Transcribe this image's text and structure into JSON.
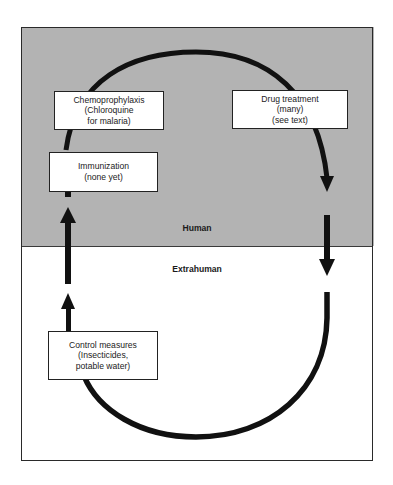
{
  "diagram": {
    "zones": {
      "human": {
        "label": "Human",
        "fill": "#b3b3b3"
      },
      "extrahuman": {
        "label": "Extrahuman",
        "fill": "#ffffff"
      }
    },
    "intervention_boxes": {
      "chemoprophylaxis": {
        "lines": [
          "Chemoprophylaxis",
          "(Chloroquine",
          "for malaria)"
        ]
      },
      "drug_treatment": {
        "lines": [
          "Drug treatment",
          "(many)",
          "(see text)"
        ]
      },
      "immunization": {
        "lines": [
          "Immunization",
          "(none yet)"
        ]
      },
      "control_measures": {
        "lines": [
          "Control measures",
          "(Insecticides,",
          "potable water)"
        ]
      }
    },
    "cycle": {
      "description": "Transmission cycle loop, human to extrahuman and back",
      "stroke_color": "#111111"
    }
  }
}
